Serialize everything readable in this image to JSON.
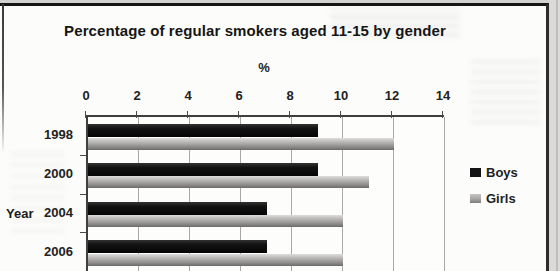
{
  "title": "Percentage of regular smokers aged 11-15 by gender",
  "chart_data": {
    "type": "bar",
    "orientation": "horizontal",
    "title": "Percentage of regular smokers aged 11-15 by gender",
    "xlabel": "%",
    "ylabel": "Year",
    "categories": [
      "1998",
      "2000",
      "2004",
      "2006"
    ],
    "series": [
      {
        "name": "Boys",
        "color": "#141414",
        "values": [
          9,
          9,
          7,
          7
        ]
      },
      {
        "name": "Girls",
        "color": "#a2a19f",
        "values": [
          12,
          11,
          10,
          10
        ]
      }
    ],
    "xlim": [
      0,
      14
    ],
    "x_ticks": [
      0,
      2,
      4,
      6,
      8,
      10,
      12,
      14
    ],
    "grid": true,
    "legend_position": "right",
    "legend_entries": [
      "Boys",
      "Girls"
    ]
  }
}
